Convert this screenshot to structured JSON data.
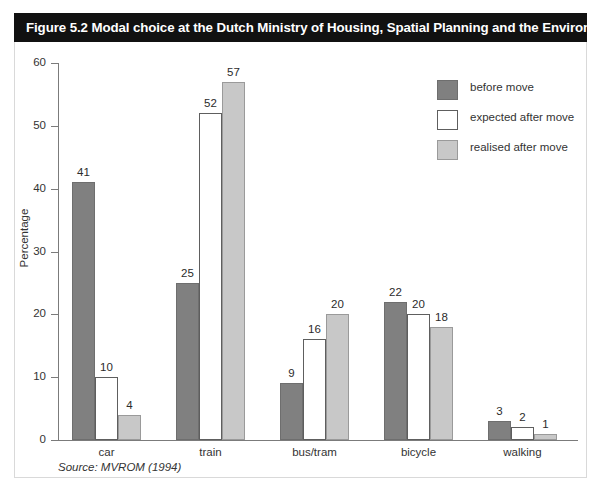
{
  "figure": {
    "number": "Figure 5.2",
    "title": "Figure 5.2   Modal choice at the Dutch Ministry of Housing, Spatial Planning and the Environment",
    "source": "Source: MVROM (1994)"
  },
  "colors": {
    "title_bar_background": "#111111",
    "title_bar_text": "#ffffff",
    "before_move": "#808080",
    "expected_after_move": "#ffffff",
    "realised_after_move": "#c8c8c8",
    "axis": "#7b7b7b"
  },
  "legend": {
    "position": "top-right",
    "items": [
      {
        "label": "before move",
        "swatch": "before"
      },
      {
        "label": "expected after move",
        "swatch": "expected"
      },
      {
        "label": "realised after move",
        "swatch": "realised"
      }
    ]
  },
  "axis": {
    "y_title": "Percentage",
    "y_ticks": [
      "0",
      "10",
      "20",
      "30",
      "40",
      "50",
      "60"
    ]
  },
  "chart_data": {
    "type": "bar",
    "title": "Modal choice at the Dutch Ministry of Housing, Spatial Planning and the Environment",
    "xlabel": "",
    "ylabel": "Percentage",
    "ylim": [
      0,
      60
    ],
    "ytick_step": 10,
    "grid": false,
    "legend_position": "top-right",
    "categories": [
      "car",
      "train",
      "bus/tram",
      "bicycle",
      "walking"
    ],
    "series": [
      {
        "name": "before move",
        "values": [
          41,
          25,
          9,
          22,
          3
        ]
      },
      {
        "name": "expected after move",
        "values": [
          10,
          52,
          16,
          20,
          2
        ]
      },
      {
        "name": "realised after move",
        "values": [
          4,
          57,
          20,
          18,
          1
        ]
      }
    ]
  }
}
